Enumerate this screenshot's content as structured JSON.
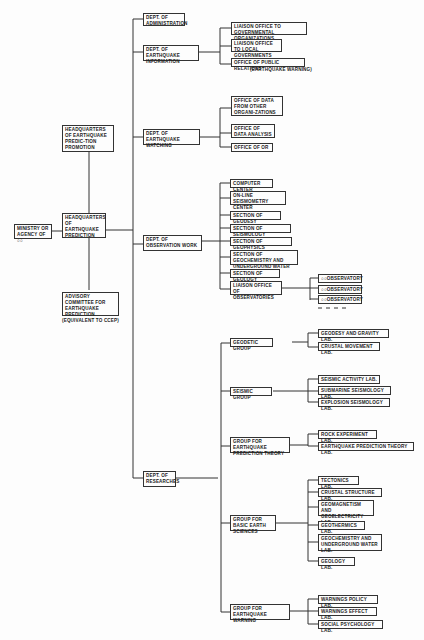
{
  "diagram": {
    "type": "org-chart",
    "ministry": "Ministry or Agency of ○○",
    "headquarters": "Headquarters of Earthquake Prediction",
    "promotion_hq": "Headquarters of Earthquake Predic-tion Promotion",
    "advisory": "Advisory Committee for Earthquake Prediction",
    "advisory_note": "(Equivalent to CCEP)",
    "departments": [
      {
        "name": "Dept. of Administration",
        "children": []
      },
      {
        "name": "Dept. of Earthquake Information",
        "children": [
          "Liaison Office to Governmental Organizations",
          "Liaison Office to Local Governments",
          "Office of Public Relations"
        ],
        "note": "(Earthquake Warning)"
      },
      {
        "name": "Dept. of Earthquake Watching",
        "children": [
          "Office of Data from Other Organi-zations",
          "Office of Data Analysis",
          "Office of OR"
        ]
      },
      {
        "name": "Dept. of Observation Work",
        "children": [
          "Computer Center",
          "On-line Seismometry Center",
          "Section of Geodesy",
          "Section of Seismology",
          "Section of Geophysics",
          "Section of Geochemistry and Underground Water",
          "Section of Geology",
          "Liaison Office of Observatories"
        ],
        "observatories": [
          "○○Observatory",
          "○○Observatory",
          "○○Observatory"
        ]
      },
      {
        "name": "Dept. of Researches",
        "groups": [
          {
            "name": "Geodetic Group",
            "labs": [
              "Geodesy and Gravity Lab.",
              "Crustal Movement Lab."
            ]
          },
          {
            "name": "Seismic Group",
            "labs": [
              "Seismic Activity Lab.",
              "Submarine Seismology Lab.",
              "Explosion Seismology Lab."
            ]
          },
          {
            "name": "Group for Earthquake Prediction Theory",
            "labs": [
              "Rock Experiment Lab.",
              "Earthquake Prediction Theory Lab."
            ]
          },
          {
            "name": "Group for Basic Earth Sciences",
            "labs": [
              "Tectonics Lab.",
              "Crustal Structure Lab.",
              "Geomagnetism and Geoelectricity Lab.",
              "Geothermics Lab.",
              "Geochemistry and Underground Water Lab.",
              "Geology Lab."
            ]
          },
          {
            "name": "Group for Earthquake Warning",
            "labs": [
              "Warnings Policy Lab.",
              "Warnings Effect Lab.",
              "Social Psychology Lab."
            ]
          }
        ]
      }
    ]
  }
}
